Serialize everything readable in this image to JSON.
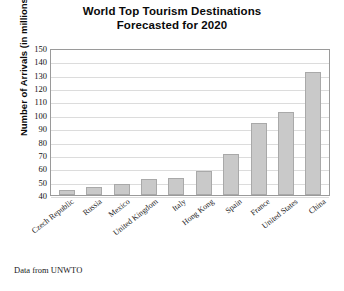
{
  "chart_data": {
    "type": "bar",
    "title": "World Top Tourism Destinations Forecasted for 2020",
    "title_lines": [
      "World Top Tourism Destinations",
      "Forecasted for 2020"
    ],
    "xlabel": "",
    "ylabel": "Number of Arrivals (in millions)",
    "categories": [
      "Czech Republic",
      "Russia",
      "Mexico",
      "United Kingdom",
      "Italy",
      "Hong Kong",
      "Spain",
      "France",
      "United States",
      "China"
    ],
    "values": [
      44,
      46,
      48,
      52,
      53,
      58,
      71,
      94,
      102,
      132
    ],
    "ylim": [
      40,
      150
    ],
    "ytick_step": 10,
    "yticks": [
      150,
      140,
      130,
      120,
      110,
      100,
      90,
      80,
      70,
      60,
      50,
      40
    ],
    "grid": true,
    "legend": false,
    "legend_position": "none",
    "bar_color": "#c9c9c9",
    "bar_edge_color": "#a9a9a9",
    "gridline_color": "#dcdcdc",
    "frame_color": "#9a9a9a",
    "source_note": "Data from UNWTO"
  }
}
